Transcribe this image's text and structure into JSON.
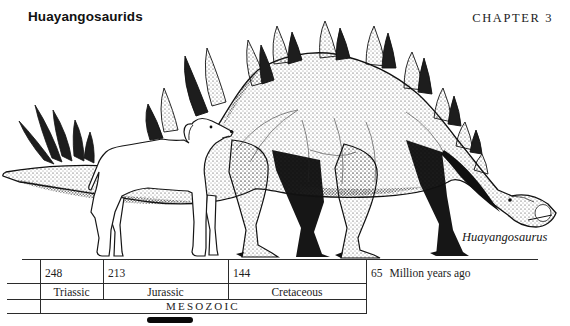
{
  "header": {
    "title": "Huayangosaurids",
    "chapter": "CHAPTER 3"
  },
  "figure": {
    "species_label": "Huayangosaurus",
    "illustration": "huayangosaurus-stippled-engraving-side-view",
    "scale_reference": "dog-silhouette-outline",
    "ink_color": "#1a1a1a",
    "paper_color": "#ffffff"
  },
  "timeline": {
    "boundaries_mya": [
      "248",
      "213",
      "144",
      "65"
    ],
    "unit_label": "Million years ago",
    "periods": [
      {
        "label": "Triassic",
        "start_mya": 248,
        "end_mya": 213
      },
      {
        "label": "Jurassic",
        "start_mya": 213,
        "end_mya": 144
      },
      {
        "label": "Cretaceous",
        "start_mya": 144,
        "end_mya": 65
      }
    ],
    "era_label": "MESOZOIC"
  }
}
